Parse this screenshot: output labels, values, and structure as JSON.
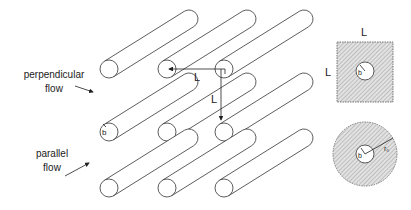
{
  "labels": {
    "perpendicular_line1": "perpendicular",
    "perpendicular_line2": "flow",
    "parallel_line1": "parallel",
    "parallel_line2": "flow",
    "spacing_horizontal": "L",
    "spacing_vertical": "L",
    "radius_b": "b",
    "square_top": "L",
    "square_left": "L",
    "square_radius": "b",
    "circle_inner_radius": "b",
    "circle_outer_radius": "r₀"
  },
  "colors": {
    "line": "#333333",
    "hatch_fill": "#d4d4d4"
  }
}
